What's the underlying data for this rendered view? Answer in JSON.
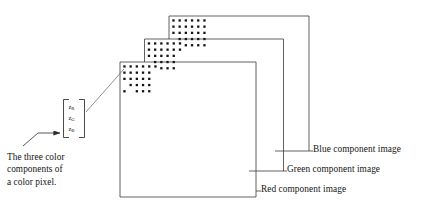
{
  "figure": {
    "background_color": "#ffffff",
    "stroke_color": "#3a3a3a",
    "dot_color": "#141414"
  },
  "planes": [
    {
      "id": "blue",
      "name": "blue-component-plane",
      "label": "Blue component image",
      "x": 169,
      "y": 16,
      "width": 140,
      "height": 135,
      "dot_grid": {
        "cols": 6,
        "rows": 5,
        "spacing": 6.2,
        "dot_size": 2.3,
        "origin_x": 4.5,
        "origin_y": 4.5
      }
    },
    {
      "id": "green",
      "name": "green-component-plane",
      "label": "Green component image",
      "x": 144.5,
      "y": 39,
      "width": 139,
      "height": 132,
      "dot_grid": {
        "cols": 6,
        "rows": 5,
        "spacing": 6.2,
        "dot_size": 2.3,
        "origin_x": 4.5,
        "origin_y": 4.5
      }
    },
    {
      "id": "red",
      "name": "red-component-plane",
      "label": "Red component image",
      "x": 120,
      "y": 62,
      "width": 136,
      "height": 135,
      "dot_grid": {
        "cols": 6,
        "rows": 5,
        "spacing": 6.2,
        "dot_size": 2.3,
        "origin_x": 4.5,
        "origin_y": 4.5
      }
    }
  ],
  "labels": {
    "blue": "Blue component image",
    "green": "Green component image",
    "red": "Red component image"
  },
  "pixel_vector": {
    "name": "color-pixel-vector",
    "bracket": {
      "x": 63.5,
      "y": 99.5,
      "width": 21,
      "height": 38
    },
    "components": [
      {
        "symbol": "z",
        "subscript": "R"
      },
      {
        "symbol": "z",
        "subscript": "G"
      },
      {
        "symbol": "z",
        "subscript": "B"
      }
    ]
  },
  "caption": {
    "name": "three-color-components-caption",
    "lines": [
      "The three color",
      "components of",
      "a color pixel."
    ],
    "full_text": "The three color components of a color pixel."
  }
}
